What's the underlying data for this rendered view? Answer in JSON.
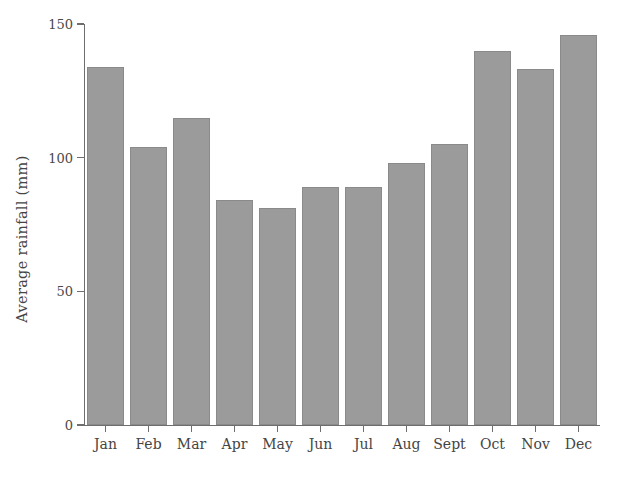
{
  "chart_data": {
    "type": "bar",
    "title": "",
    "xlabel": "",
    "ylabel": "Average rainfall (mm)",
    "categories": [
      "Jan",
      "Feb",
      "Mar",
      "Apr",
      "May",
      "Jun",
      "Jul",
      "Aug",
      "Sept",
      "Oct",
      "Nov",
      "Dec"
    ],
    "values": [
      134,
      104,
      115,
      84,
      81,
      89,
      89,
      98,
      105,
      140,
      133,
      146
    ],
    "ylim": [
      0,
      150
    ],
    "yticks": [
      0,
      50,
      100,
      150
    ],
    "ytick_labels": [
      "0",
      "50",
      "100",
      "150"
    ],
    "grid": false,
    "legend": null,
    "bar_color": "#9b9b9b",
    "bar_edge_color": "#8a8a8a",
    "axis_color": "#6e6e6e",
    "text_color": "#454545"
  }
}
